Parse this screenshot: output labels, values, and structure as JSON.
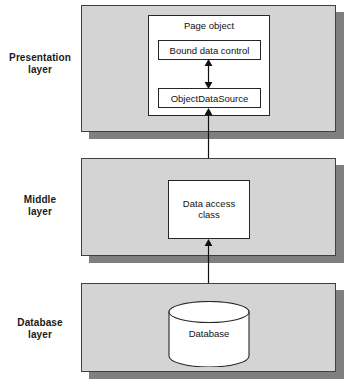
{
  "diagram": {
    "colors": {
      "slab_fill": "#d4d4d4",
      "slab_border": "#404040",
      "slab_shadow": "#7f7f7f",
      "box_fill": "#ffffff",
      "box_border": "#262626",
      "arrow": "#111111",
      "background": "#ffffff",
      "text": "#111111"
    },
    "layers": [
      {
        "id": "presentation",
        "label_line1": "Presentation",
        "label_line2": "layer",
        "container_label": "Page object",
        "boxes": [
          {
            "id": "bound-data-control",
            "label": "Bound data control"
          },
          {
            "id": "objectdatasource",
            "label": "ObjectDataSource"
          }
        ]
      },
      {
        "id": "middle",
        "label_line1": "Middle",
        "label_line2": "layer",
        "boxes": [
          {
            "id": "data-access-class",
            "label_line1": "Data access",
            "label_line2": "class"
          }
        ]
      },
      {
        "id": "database",
        "label_line1": "Database",
        "label_line2": "layer",
        "boxes": [
          {
            "id": "database-cylinder",
            "label": "Database"
          }
        ]
      }
    ],
    "connectors": [
      {
        "id": "bound-to-ods",
        "from": "bound-data-control",
        "to": "objectdatasource",
        "style": "double-headed"
      },
      {
        "id": "ods-to-dac",
        "from": "objectdatasource",
        "to": "data-access-class",
        "style": "double-headed"
      },
      {
        "id": "dac-to-db",
        "from": "data-access-class",
        "to": "database-cylinder",
        "style": "double-headed"
      }
    ]
  }
}
